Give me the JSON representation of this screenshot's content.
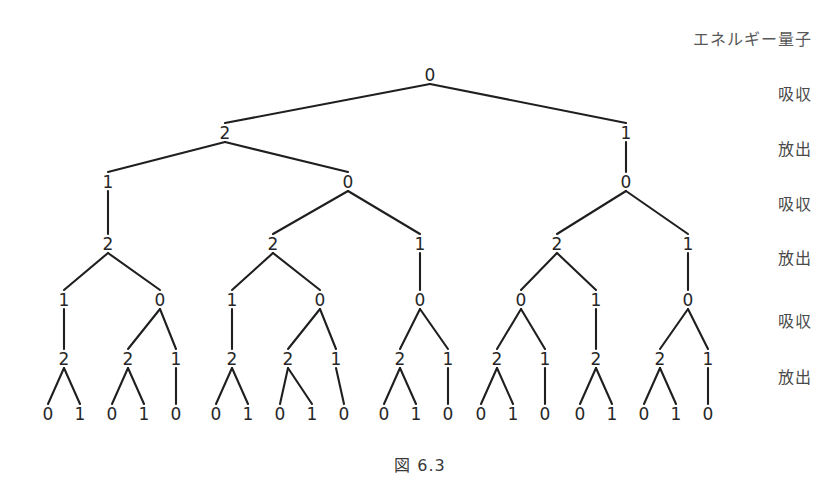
{
  "figure": {
    "caption": "図 6.3",
    "caption_y": 452,
    "background": "#ffffff",
    "line_color": "#1f1f1f",
    "text_color": "#262626"
  },
  "stage_labels": [
    {
      "text": "エネルギー量子",
      "y": 40,
      "head": true
    },
    {
      "text": "吸収",
      "y": 95,
      "head": false
    },
    {
      "text": "放出",
      "y": 150,
      "head": false
    },
    {
      "text": "吸収",
      "y": 205,
      "head": false
    },
    {
      "text": "放出",
      "y": 259,
      "head": false
    },
    {
      "text": "吸収",
      "y": 322,
      "head": false
    },
    {
      "text": "放出",
      "y": 378,
      "head": false
    }
  ],
  "tree": {
    "level_y": [
      75,
      133,
      182,
      244,
      300,
      359,
      414
    ],
    "nodes": [
      {
        "id": "n0",
        "level": 0,
        "x": 430,
        "y": 75,
        "label": "0"
      },
      {
        "id": "n0-0",
        "level": 1,
        "x": 225,
        "y": 133,
        "label": "2"
      },
      {
        "id": "n0-1",
        "level": 1,
        "x": 626,
        "y": 133,
        "label": "1"
      },
      {
        "id": "n1-0",
        "level": 2,
        "x": 108,
        "y": 182,
        "label": "1"
      },
      {
        "id": "n1-1",
        "level": 2,
        "x": 348,
        "y": 182,
        "label": "0"
      },
      {
        "id": "n1-2",
        "level": 2,
        "x": 626,
        "y": 182,
        "label": "0"
      },
      {
        "id": "n2-0",
        "level": 3,
        "x": 108,
        "y": 244,
        "label": "2"
      },
      {
        "id": "n2-1",
        "level": 3,
        "x": 273,
        "y": 244,
        "label": "2"
      },
      {
        "id": "n2-2",
        "level": 3,
        "x": 420,
        "y": 244,
        "label": "1"
      },
      {
        "id": "n2-3",
        "level": 3,
        "x": 557,
        "y": 244,
        "label": "2"
      },
      {
        "id": "n2-4",
        "level": 3,
        "x": 688,
        "y": 244,
        "label": "1"
      },
      {
        "id": "n3-0",
        "level": 4,
        "x": 64,
        "y": 300,
        "label": "1"
      },
      {
        "id": "n3-1",
        "level": 4,
        "x": 160,
        "y": 300,
        "label": "0"
      },
      {
        "id": "n3-2",
        "level": 4,
        "x": 232,
        "y": 300,
        "label": "1"
      },
      {
        "id": "n3-3",
        "level": 4,
        "x": 320,
        "y": 300,
        "label": "0"
      },
      {
        "id": "n3-4",
        "level": 4,
        "x": 420,
        "y": 300,
        "label": "0"
      },
      {
        "id": "n3-5",
        "level": 4,
        "x": 521,
        "y": 300,
        "label": "0"
      },
      {
        "id": "n3-6",
        "level": 4,
        "x": 596,
        "y": 300,
        "label": "1"
      },
      {
        "id": "n3-7",
        "level": 4,
        "x": 688,
        "y": 300,
        "label": "0"
      },
      {
        "id": "n4-0",
        "level": 5,
        "x": 64,
        "y": 359,
        "label": "2"
      },
      {
        "id": "n4-1",
        "level": 5,
        "x": 128,
        "y": 359,
        "label": "2"
      },
      {
        "id": "n4-2",
        "level": 5,
        "x": 176,
        "y": 359,
        "label": "1"
      },
      {
        "id": "n4-3",
        "level": 5,
        "x": 232,
        "y": 359,
        "label": "2"
      },
      {
        "id": "n4-4",
        "level": 5,
        "x": 288,
        "y": 359,
        "label": "2"
      },
      {
        "id": "n4-5",
        "level": 5,
        "x": 336,
        "y": 359,
        "label": "1"
      },
      {
        "id": "n4-6",
        "level": 5,
        "x": 400,
        "y": 359,
        "label": "2"
      },
      {
        "id": "n4-7",
        "level": 5,
        "x": 448,
        "y": 359,
        "label": "1"
      },
      {
        "id": "n4-8",
        "level": 5,
        "x": 497,
        "y": 359,
        "label": "2"
      },
      {
        "id": "n4-9",
        "level": 5,
        "x": 545,
        "y": 359,
        "label": "1"
      },
      {
        "id": "n4-10",
        "level": 5,
        "x": 596,
        "y": 359,
        "label": "2"
      },
      {
        "id": "n4-11",
        "level": 5,
        "x": 660,
        "y": 359,
        "label": "2"
      },
      {
        "id": "n4-12",
        "level": 5,
        "x": 708,
        "y": 359,
        "label": "1"
      },
      {
        "id": "n5-0",
        "level": 6,
        "x": 48,
        "y": 414,
        "label": "0"
      },
      {
        "id": "n5-1",
        "level": 6,
        "x": 80,
        "y": 414,
        "label": "1"
      },
      {
        "id": "n5-2",
        "level": 6,
        "x": 112,
        "y": 414,
        "label": "0"
      },
      {
        "id": "n5-3",
        "level": 6,
        "x": 144,
        "y": 414,
        "label": "1"
      },
      {
        "id": "n5-4",
        "level": 6,
        "x": 176,
        "y": 414,
        "label": "0"
      },
      {
        "id": "n5-5",
        "level": 6,
        "x": 216,
        "y": 414,
        "label": "0"
      },
      {
        "id": "n5-6",
        "level": 6,
        "x": 248,
        "y": 414,
        "label": "1"
      },
      {
        "id": "n5-7",
        "level": 6,
        "x": 280,
        "y": 414,
        "label": "0"
      },
      {
        "id": "n5-8",
        "level": 6,
        "x": 312,
        "y": 414,
        "label": "1"
      },
      {
        "id": "n5-9",
        "level": 6,
        "x": 344,
        "y": 414,
        "label": "0"
      },
      {
        "id": "n5-10",
        "level": 6,
        "x": 384,
        "y": 414,
        "label": "0"
      },
      {
        "id": "n5-11",
        "level": 6,
        "x": 416,
        "y": 414,
        "label": "1"
      },
      {
        "id": "n5-12",
        "level": 6,
        "x": 448,
        "y": 414,
        "label": "0"
      },
      {
        "id": "n5-13",
        "level": 6,
        "x": 481,
        "y": 414,
        "label": "0"
      },
      {
        "id": "n5-14",
        "level": 6,
        "x": 513,
        "y": 414,
        "label": "1"
      },
      {
        "id": "n5-15",
        "level": 6,
        "x": 545,
        "y": 414,
        "label": "0"
      },
      {
        "id": "n5-16",
        "level": 6,
        "x": 580,
        "y": 414,
        "label": "0"
      },
      {
        "id": "n5-17",
        "level": 6,
        "x": 612,
        "y": 414,
        "label": "1"
      },
      {
        "id": "n5-18",
        "level": 6,
        "x": 644,
        "y": 414,
        "label": "0"
      },
      {
        "id": "n5-19",
        "level": 6,
        "x": 676,
        "y": 414,
        "label": "1"
      },
      {
        "id": "n5-20",
        "level": 6,
        "x": 708,
        "y": 414,
        "label": "0"
      }
    ],
    "edges": [
      [
        "n0",
        "n0-0"
      ],
      [
        "n0",
        "n0-1"
      ],
      [
        "n0-0",
        "n1-0"
      ],
      [
        "n0-0",
        "n1-1"
      ],
      [
        "n0-1",
        "n1-2"
      ],
      [
        "n1-0",
        "n2-0"
      ],
      [
        "n1-1",
        "n2-1"
      ],
      [
        "n1-1",
        "n2-2"
      ],
      [
        "n1-2",
        "n2-3"
      ],
      [
        "n1-2",
        "n2-4"
      ],
      [
        "n2-0",
        "n3-0"
      ],
      [
        "n2-0",
        "n3-1"
      ],
      [
        "n2-1",
        "n3-2"
      ],
      [
        "n2-1",
        "n3-3"
      ],
      [
        "n2-2",
        "n3-4"
      ],
      [
        "n2-3",
        "n3-5"
      ],
      [
        "n2-3",
        "n3-6"
      ],
      [
        "n2-4",
        "n3-7"
      ],
      [
        "n3-0",
        "n4-0"
      ],
      [
        "n3-1",
        "n4-1"
      ],
      [
        "n3-1",
        "n4-2"
      ],
      [
        "n3-2",
        "n4-3"
      ],
      [
        "n3-3",
        "n4-4"
      ],
      [
        "n3-3",
        "n4-5"
      ],
      [
        "n3-4",
        "n4-6"
      ],
      [
        "n3-4",
        "n4-7"
      ],
      [
        "n3-5",
        "n4-8"
      ],
      [
        "n3-5",
        "n4-9"
      ],
      [
        "n3-6",
        "n4-10"
      ],
      [
        "n3-7",
        "n4-11"
      ],
      [
        "n3-7",
        "n4-12"
      ],
      [
        "n4-0",
        "n5-0"
      ],
      [
        "n4-0",
        "n5-1"
      ],
      [
        "n4-1",
        "n5-2"
      ],
      [
        "n4-1",
        "n5-3"
      ],
      [
        "n4-2",
        "n5-4"
      ],
      [
        "n4-3",
        "n5-5"
      ],
      [
        "n4-3",
        "n5-6"
      ],
      [
        "n4-4",
        "n5-7"
      ],
      [
        "n4-4",
        "n5-8"
      ],
      [
        "n4-5",
        "n5-9"
      ],
      [
        "n4-6",
        "n5-10"
      ],
      [
        "n4-6",
        "n5-11"
      ],
      [
        "n4-7",
        "n5-12"
      ],
      [
        "n4-8",
        "n5-13"
      ],
      [
        "n4-8",
        "n5-14"
      ],
      [
        "n4-9",
        "n5-15"
      ],
      [
        "n4-10",
        "n5-16"
      ],
      [
        "n4-10",
        "n5-17"
      ],
      [
        "n4-11",
        "n5-18"
      ],
      [
        "n4-11",
        "n5-19"
      ],
      [
        "n4-12",
        "n5-20"
      ]
    ]
  }
}
